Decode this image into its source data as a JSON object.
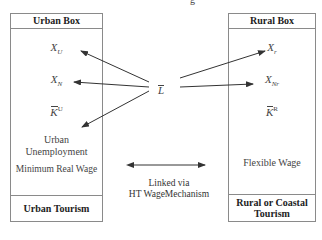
{
  "title_fragment": "g",
  "center": {
    "label": "L",
    "description": "L-bar (total labor endowment)"
  },
  "urban_box": {
    "title": "Urban Box",
    "items": [
      {
        "base": "X",
        "sub": "U"
      },
      {
        "base": "X",
        "sub": "N"
      },
      {
        "base": "K",
        "sup": "U",
        "bar": true
      }
    ],
    "unemployment": "Urban\nUnemployment",
    "unemployment_line1": "Urban",
    "unemployment_line2": "Unemployment",
    "wage": "Minimum Real Wage",
    "footer": "Urban Tourism"
  },
  "rural_box": {
    "title": "Rural Box",
    "items": [
      {
        "base": "X",
        "sub": "r"
      },
      {
        "base": "X",
        "sub": "Nr"
      },
      {
        "base": "K",
        "sup": "R",
        "bar": true
      }
    ],
    "wage": "Flexible Wage",
    "footer_line1": "Rural or Coastal",
    "footer_line2": "Tourism"
  },
  "link": {
    "line1": "Linked via",
    "line2": "HT WageMechanism"
  },
  "colors": {
    "border": "#8a8a8a",
    "arrow": "#333333",
    "text": "#444444"
  }
}
